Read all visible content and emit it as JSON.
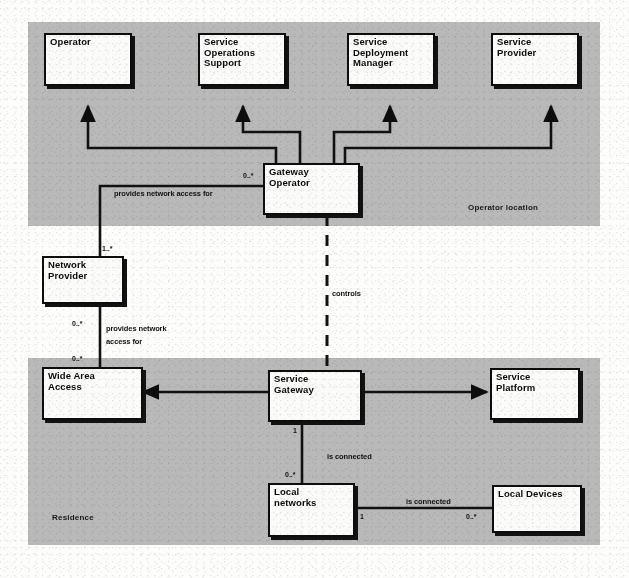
{
  "diagram": {
    "kind": "uml-class-diagram",
    "regions": [
      {
        "id": "operator-location",
        "label": "Operator location",
        "fill": "#b9b9b9"
      },
      {
        "id": "residence",
        "label": "Residence",
        "fill": "#b9b9b9"
      }
    ],
    "nodes": [
      {
        "id": "operator",
        "label": "Operator"
      },
      {
        "id": "service-operations-support",
        "label": "Service\nOperations\nSupport"
      },
      {
        "id": "service-deployment-manager",
        "label": "Service\nDeployment\nManager"
      },
      {
        "id": "service-provider",
        "label": "Service\nProvider"
      },
      {
        "id": "gateway-operator",
        "label": "Gateway\nOperator"
      },
      {
        "id": "network-provider",
        "label": "Network\nProvider"
      },
      {
        "id": "wide-area-access",
        "label": "Wide Area\nAccess"
      },
      {
        "id": "service-gateway",
        "label": "Service\nGateway"
      },
      {
        "id": "service-platform",
        "label": "Service\nPlatform"
      },
      {
        "id": "local-networks",
        "label": "Local\nnetworks"
      },
      {
        "id": "local-devices",
        "label": "Local Devices"
      }
    ],
    "edge_labels": [
      {
        "id": "provides-network-access-for-gw",
        "text": "provides network access for"
      },
      {
        "id": "provides-network-1",
        "text": "provides network"
      },
      {
        "id": "provides-network-2",
        "text": "access for"
      },
      {
        "id": "controls",
        "text": "controls"
      },
      {
        "id": "is-connected-gateway",
        "text": "is connected"
      },
      {
        "id": "is-connected-devices",
        "text": "is connected"
      }
    ],
    "multiplicities": [
      {
        "id": "gw-operator-left",
        "text": "0..*"
      },
      {
        "id": "network-provider-top",
        "text": "1..*"
      },
      {
        "id": "network-provider-bottom",
        "text": "0..*"
      },
      {
        "id": "wide-area-access-top",
        "text": "0..*"
      },
      {
        "id": "service-gateway-bottom",
        "text": "1"
      },
      {
        "id": "local-networks-top",
        "text": "0..*"
      },
      {
        "id": "local-networks-right",
        "text": "1"
      },
      {
        "id": "local-devices-left",
        "text": "0..*"
      }
    ],
    "colors": {
      "ink": "#0d0d0d",
      "node_fill": "#fbfbfa",
      "region_fill": "#b9b9b9",
      "page": "#fdfdfc"
    }
  }
}
